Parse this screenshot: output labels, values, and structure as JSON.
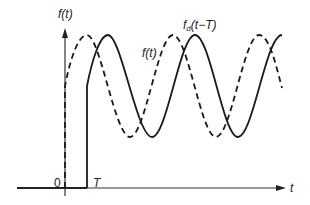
{
  "diagram": {
    "y_axis_label": "f(t)",
    "x_axis_label": "t",
    "origin_label": "0",
    "delay_label": "T",
    "curve_labels": {
      "original": "f(t)",
      "delayed_main": "f",
      "delayed_sub": "d",
      "delayed_arg": "(t−T)"
    },
    "curves": [
      {
        "name": "f(t)",
        "style": "dashed",
        "color": "#1a1a1a",
        "starts_at": "0"
      },
      {
        "name": "f_d(t-T)",
        "style": "solid",
        "color": "#1a1a1a",
        "starts_at": "T"
      }
    ]
  }
}
